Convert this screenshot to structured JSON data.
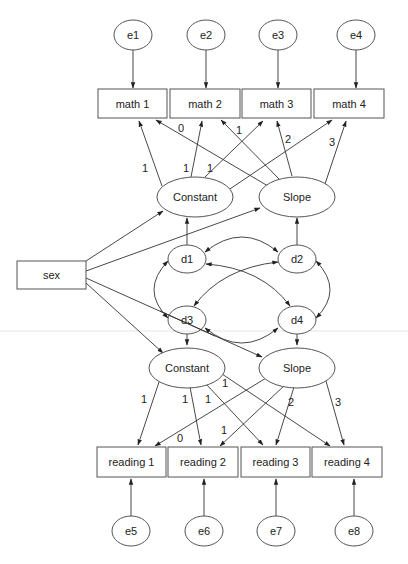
{
  "diagram": {
    "type": "latent growth curve model (path diagram)",
    "nodes": {
      "e1": {
        "label": "e1",
        "shape": "ellipse"
      },
      "e2": {
        "label": "e2",
        "shape": "ellipse"
      },
      "e3": {
        "label": "e3",
        "shape": "ellipse"
      },
      "e4": {
        "label": "e4",
        "shape": "ellipse"
      },
      "math1": {
        "label": "math 1",
        "shape": "rect"
      },
      "math2": {
        "label": "math 2",
        "shape": "rect"
      },
      "math3": {
        "label": "math 3",
        "shape": "rect"
      },
      "math4": {
        "label": "math 4",
        "shape": "rect"
      },
      "constant_math": {
        "label": "Constant",
        "shape": "ellipse"
      },
      "slope_math": {
        "label": "Slope",
        "shape": "ellipse"
      },
      "sex": {
        "label": "sex",
        "shape": "rect"
      },
      "d1": {
        "label": "d1",
        "shape": "ellipse"
      },
      "d2": {
        "label": "d2",
        "shape": "ellipse"
      },
      "d3": {
        "label": "d3",
        "shape": "ellipse"
      },
      "d4": {
        "label": "d4",
        "shape": "ellipse"
      },
      "constant_reading": {
        "label": "Constant",
        "shape": "ellipse"
      },
      "slope_reading": {
        "label": "Slope",
        "shape": "ellipse"
      },
      "reading1": {
        "label": "reading 1",
        "shape": "rect"
      },
      "reading2": {
        "label": "reading 2",
        "shape": "rect"
      },
      "reading3": {
        "label": "reading 3",
        "shape": "rect"
      },
      "reading4": {
        "label": "reading 4",
        "shape": "rect"
      },
      "e5": {
        "label": "e5",
        "shape": "ellipse"
      },
      "e6": {
        "label": "e6",
        "shape": "ellipse"
      },
      "e7": {
        "label": "e7",
        "shape": "ellipse"
      },
      "e8": {
        "label": "e8",
        "shape": "ellipse"
      }
    },
    "weights": {
      "cm_m1": "1",
      "cm_m2": "1",
      "cm_m3": "1",
      "sm_m1": "0",
      "sm_m2": "1",
      "sm_m3": "2",
      "sm_m4": "3",
      "cr_r1": "1",
      "cr_r2": "1",
      "cr_r3": "1",
      "cr_r4": "1",
      "sr_r1": "0",
      "sr_r2": "1",
      "sr_r3": "2",
      "sr_r4": "3"
    },
    "edges": [
      {
        "from": "e1",
        "to": "math1"
      },
      {
        "from": "e2",
        "to": "math2"
      },
      {
        "from": "e3",
        "to": "math3"
      },
      {
        "from": "e4",
        "to": "math4"
      },
      {
        "from": "constant_math",
        "to": "math1",
        "weight": "1"
      },
      {
        "from": "constant_math",
        "to": "math2",
        "weight": "1"
      },
      {
        "from": "constant_math",
        "to": "math3",
        "weight": "1"
      },
      {
        "from": "constant_math",
        "to": "math4"
      },
      {
        "from": "slope_math",
        "to": "math1",
        "weight": "0"
      },
      {
        "from": "slope_math",
        "to": "math2",
        "weight": "1"
      },
      {
        "from": "slope_math",
        "to": "math3",
        "weight": "2"
      },
      {
        "from": "slope_math",
        "to": "math4",
        "weight": "3"
      },
      {
        "from": "sex",
        "to": "constant_math"
      },
      {
        "from": "sex",
        "to": "slope_math"
      },
      {
        "from": "sex",
        "to": "constant_reading"
      },
      {
        "from": "sex",
        "to": "slope_reading"
      },
      {
        "from": "d1",
        "to": "constant_math"
      },
      {
        "from": "d2",
        "to": "slope_math"
      },
      {
        "from": "d3",
        "to": "constant_reading"
      },
      {
        "from": "d4",
        "to": "slope_reading"
      },
      {
        "from": "d1",
        "to": "d2",
        "type": "covariance"
      },
      {
        "from": "d1",
        "to": "d3",
        "type": "covariance"
      },
      {
        "from": "d1",
        "to": "d4",
        "type": "covariance"
      },
      {
        "from": "d2",
        "to": "d3",
        "type": "covariance"
      },
      {
        "from": "d2",
        "to": "d4",
        "type": "covariance"
      },
      {
        "from": "d3",
        "to": "d4",
        "type": "covariance"
      },
      {
        "from": "constant_reading",
        "to": "reading1",
        "weight": "1"
      },
      {
        "from": "constant_reading",
        "to": "reading2",
        "weight": "1"
      },
      {
        "from": "constant_reading",
        "to": "reading3",
        "weight": "1"
      },
      {
        "from": "constant_reading",
        "to": "reading4",
        "weight": "1"
      },
      {
        "from": "slope_reading",
        "to": "reading1",
        "weight": "0"
      },
      {
        "from": "slope_reading",
        "to": "reading2",
        "weight": "1"
      },
      {
        "from": "slope_reading",
        "to": "reading3",
        "weight": "2"
      },
      {
        "from": "slope_reading",
        "to": "reading4",
        "weight": "3"
      },
      {
        "from": "e5",
        "to": "reading1"
      },
      {
        "from": "e6",
        "to": "reading2"
      },
      {
        "from": "e7",
        "to": "reading3"
      },
      {
        "from": "e8",
        "to": "reading4"
      }
    ]
  }
}
